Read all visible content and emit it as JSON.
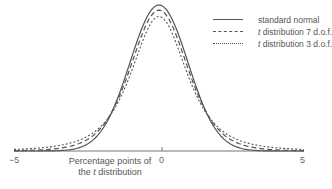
{
  "chart_data": {
    "type": "line",
    "title": "",
    "xlabel": "Percentage points of the t distribution",
    "xlabel_line1": "Percentage points of",
    "xlabel_line2_prefix": "the ",
    "xlabel_line2_italic": "t",
    "xlabel_line2_suffix": " distribution",
    "ylabel": "",
    "xlim": [
      -5,
      5
    ],
    "x_ticks": [
      -5,
      0,
      5
    ],
    "x_tick_labels": [
      "−5",
      "0",
      "5"
    ],
    "grid": false,
    "legend_position": "upper right",
    "series": [
      {
        "name": "standard normal",
        "style": "solid",
        "dof": null
      },
      {
        "name": "t distribution 7 d.o.f.",
        "style": "dashed",
        "dof": 7
      },
      {
        "name": "t distribution 3 d.o.f.",
        "style": "dotted",
        "dof": 3
      }
    ],
    "peak_values": {
      "standard normal": 0.399,
      "t distribution 7 d.o.f.": 0.38,
      "t distribution 3 d.o.f.": 0.368
    }
  },
  "legend": {
    "items": [
      {
        "italic": "",
        "text": "standard normal"
      },
      {
        "italic": "t",
        "text": " distribution 7 d.o.f."
      },
      {
        "italic": "t",
        "text": " distribution 3 d.o.f."
      }
    ]
  },
  "colors": {
    "line": "#555555",
    "axis": "#777777",
    "text": "#555555"
  }
}
